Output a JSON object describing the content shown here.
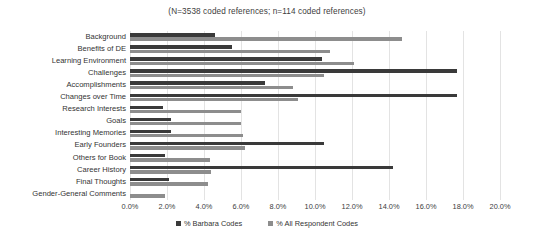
{
  "chart_data": {
    "type": "bar",
    "orientation": "horizontal",
    "title": "(N=3538 coded references; n=114 coded references)",
    "xlabel": "",
    "ylabel": "",
    "xlim": [
      0,
      20
    ],
    "xticks": [
      "0.0%",
      "2.0%",
      "4.0%",
      "6.0%",
      "8.0%",
      "10.0%",
      "12.0%",
      "14.0%",
      "16.0%",
      "18.0%",
      "20.0%"
    ],
    "xtick_values": [
      0,
      2,
      4,
      6,
      8,
      10,
      12,
      14,
      16,
      18,
      20
    ],
    "grid": true,
    "legend_position": "bottom",
    "categories": [
      "Background",
      "Benefits of DE",
      "Learning Environment",
      "Challenges",
      "Accomplishments",
      "Changes over Time",
      "Research Interests",
      "Goals",
      "Interesting Memories",
      "Early Founders",
      "Others for Book",
      "Career History",
      "Final Thoughts",
      "Gender-General Comments"
    ],
    "series": [
      {
        "name": "% Barbara Codes",
        "color": "#3a3a3a",
        "values": [
          4.6,
          5.5,
          10.4,
          17.7,
          7.3,
          17.7,
          1.8,
          2.2,
          2.2,
          10.5,
          1.9,
          14.2,
          2.1,
          0.0
        ]
      },
      {
        "name": "% All Respondent Codes",
        "color": "#8d8d8d",
        "values": [
          14.7,
          10.8,
          12.1,
          10.5,
          8.8,
          9.1,
          6.0,
          6.0,
          6.1,
          6.2,
          4.3,
          4.4,
          4.2,
          1.9
        ]
      }
    ]
  },
  "legend": {
    "items": [
      {
        "label": "% Barbara Codes",
        "swatch": "dark"
      },
      {
        "label": "% All Respondent Codes",
        "swatch": "light"
      }
    ]
  }
}
